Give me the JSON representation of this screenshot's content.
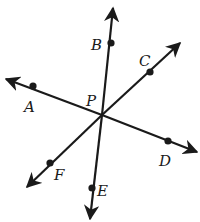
{
  "figure": {
    "colors": {
      "line": "#1a1a1a",
      "background": "#ffffff"
    },
    "center": {
      "name": "P",
      "x": 102,
      "y": 115,
      "label_x": 86,
      "label_y": 106
    },
    "rays": [
      {
        "name": "B",
        "tip_x": 113,
        "tip_y": 8,
        "dot_x": 111,
        "dot_y": 43,
        "label_x": 91,
        "label_y": 50
      },
      {
        "name": "C",
        "tip_x": 180,
        "tip_y": 43,
        "dot_x": 150,
        "dot_y": 72,
        "label_x": 139,
        "label_y": 66
      },
      {
        "name": "A",
        "tip_x": 6,
        "tip_y": 79,
        "dot_x": 33,
        "dot_y": 86,
        "label_x": 24,
        "label_y": 112
      },
      {
        "name": "D",
        "tip_x": 197,
        "tip_y": 152,
        "dot_x": 168,
        "dot_y": 141,
        "label_x": 159,
        "label_y": 166
      },
      {
        "name": "F",
        "tip_x": 27,
        "tip_y": 187,
        "dot_x": 50,
        "dot_y": 163,
        "label_x": 54,
        "label_y": 180
      },
      {
        "name": "E",
        "tip_x": 90,
        "tip_y": 219,
        "dot_x": 92,
        "dot_y": 188,
        "label_x": 97,
        "label_y": 196
      }
    ]
  }
}
